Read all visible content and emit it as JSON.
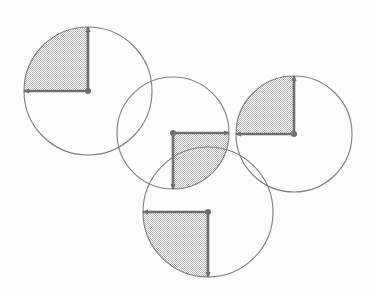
{
  "figure": {
    "caption": "",
    "width": 375,
    "height": 294,
    "background_color": "#fdfdfd",
    "stroke_color": "#7d7d7d",
    "arrow_color": "#6e6e6e",
    "shade_fill_color": "#c9c9c9",
    "shade_pattern": "checkerboard-stipple",
    "stroke_width": 1.1,
    "arrow_stroke_width": 2.6,
    "dot_radius": 3.0,
    "circles": [
      {
        "id": "circle-1",
        "label": "top-left circle",
        "cx": 88,
        "cy": 91,
        "r": 64,
        "shaded_quadrant": "upper-left",
        "arrows": [
          {
            "id": "arrow-1-up",
            "direction": "up",
            "from_x": 88,
            "from_y": 91,
            "to_x": 88,
            "to_y": 27
          },
          {
            "id": "arrow-1-left",
            "direction": "left",
            "from_x": 88,
            "from_y": 91,
            "to_x": 24,
            "to_y": 91
          }
        ]
      },
      {
        "id": "circle-2",
        "label": "middle circle",
        "cx": 173,
        "cy": 133,
        "r": 56,
        "shaded_quadrant": "lower-right",
        "arrows": [
          {
            "id": "arrow-2-right",
            "direction": "right",
            "from_x": 173,
            "from_y": 133,
            "to_x": 229,
            "to_y": 133
          },
          {
            "id": "arrow-2-down",
            "direction": "down",
            "from_x": 173,
            "from_y": 133,
            "to_x": 173,
            "to_y": 189
          }
        ]
      },
      {
        "id": "circle-3",
        "label": "right circle",
        "cx": 294,
        "cy": 134,
        "r": 58,
        "shaded_quadrant": "upper-left",
        "arrows": [
          {
            "id": "arrow-3-up",
            "direction": "up",
            "from_x": 294,
            "from_y": 134,
            "to_x": 294,
            "to_y": 76
          },
          {
            "id": "arrow-3-left",
            "direction": "left",
            "from_x": 294,
            "from_y": 134,
            "to_x": 236,
            "to_y": 134
          }
        ]
      },
      {
        "id": "circle-4",
        "label": "bottom circle",
        "cx": 208,
        "cy": 212,
        "r": 65,
        "shaded_quadrant": "lower-left",
        "arrows": [
          {
            "id": "arrow-4-left",
            "direction": "left",
            "from_x": 208,
            "from_y": 212,
            "to_x": 143,
            "to_y": 212
          },
          {
            "id": "arrow-4-down",
            "direction": "down",
            "from_x": 208,
            "from_y": 212,
            "to_x": 208,
            "to_y": 277
          }
        ]
      }
    ]
  }
}
